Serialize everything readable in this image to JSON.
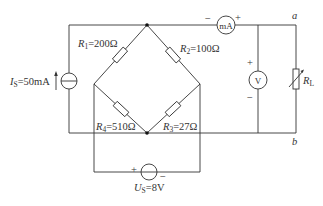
{
  "diagram": {
    "type": "circuit",
    "components": {
      "R1": {
        "symbol": "R",
        "sub": "1",
        "value": "=200Ω"
      },
      "R2": {
        "symbol": "R",
        "sub": "2",
        "value": "=100Ω"
      },
      "R3": {
        "symbol": "R",
        "sub": "3",
        "value": "=27Ω"
      },
      "R4": {
        "symbol": "R",
        "sub": "4",
        "value": "=510Ω"
      },
      "RL": {
        "symbol": "R",
        "sub": "L"
      },
      "Is": {
        "symbol": "I",
        "sub": "S",
        "value": "=50mA"
      },
      "Us": {
        "symbol": "U",
        "sub": "S",
        "value": "=8V",
        "plus": "+",
        "minus": "−"
      },
      "ammeter": {
        "label": "mA",
        "plus": "+",
        "minus": "−"
      },
      "voltmeter": {
        "label": "V",
        "plus": "+",
        "minus": "−"
      }
    },
    "nodes": {
      "a": "a",
      "b": "b"
    }
  }
}
